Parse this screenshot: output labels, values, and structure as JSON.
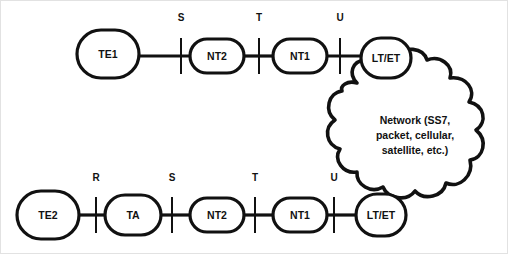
{
  "diagram": {
    "type": "network-reference-model",
    "background_color": "#ffffff",
    "line_color": "#111111",
    "rows": [
      {
        "id": "top-row",
        "nodes": [
          {
            "id": "te1",
            "label": "TE1",
            "cx": 108,
            "cy": 54,
            "rx": 31,
            "ry": 24,
            "shape": "rounded-ellipse"
          },
          {
            "id": "nt2-top",
            "label": "NT2",
            "cx": 217,
            "cy": 56,
            "rx": 27,
            "ry": 17,
            "shape": "rounded-ellipse"
          },
          {
            "id": "nt1-top",
            "label": "NT1",
            "cx": 300,
            "cy": 56,
            "rx": 27,
            "ry": 17,
            "shape": "rounded-ellipse"
          },
          {
            "id": "lt-et-top",
            "label": "LT/ET",
            "cx": 386,
            "cy": 58,
            "rx": 25,
            "ry": 19,
            "shape": "rounded-ellipse"
          }
        ],
        "reference_points": [
          {
            "id": "ref-s-top",
            "label": "S",
            "x": 181,
            "label_y": 21,
            "tick_top": 38,
            "tick_bottom": 74
          },
          {
            "id": "ref-t-top",
            "label": "T",
            "x": 259,
            "label_y": 21,
            "tick_top": 38,
            "tick_bottom": 74
          },
          {
            "id": "ref-u-top",
            "label": "U",
            "x": 340,
            "label_y": 21,
            "tick_top": 38,
            "tick_bottom": 74
          }
        ],
        "links": [
          {
            "id": "link-te1-nt2",
            "x1": 139,
            "x2": 190,
            "y": 56
          },
          {
            "id": "link-nt2-nt1",
            "x1": 244,
            "x2": 273,
            "y": 56
          },
          {
            "id": "link-nt1-lt",
            "x1": 327,
            "x2": 361,
            "y": 56
          }
        ]
      },
      {
        "id": "bottom-row",
        "nodes": [
          {
            "id": "te2",
            "label": "TE2",
            "cx": 48,
            "cy": 215,
            "rx": 31,
            "ry": 24,
            "shape": "rounded-ellipse"
          },
          {
            "id": "ta",
            "label": "TA",
            "cx": 133,
            "cy": 215,
            "rx": 28,
            "ry": 20,
            "shape": "rounded-ellipse"
          },
          {
            "id": "nt2-bottom",
            "label": "NT2",
            "cx": 217,
            "cy": 215,
            "rx": 27,
            "ry": 17,
            "shape": "rounded-ellipse"
          },
          {
            "id": "nt1-bottom",
            "label": "NT1",
            "cx": 300,
            "cy": 215,
            "rx": 27,
            "ry": 17,
            "shape": "rounded-ellipse"
          },
          {
            "id": "lt-et-bottom",
            "label": "LT/ET",
            "cx": 380,
            "cy": 214,
            "rx": 25,
            "ry": 21,
            "shape": "rounded-ellipse"
          }
        ],
        "reference_points": [
          {
            "id": "ref-r-bottom",
            "label": "R",
            "x": 96,
            "label_y": 181,
            "tick_top": 197,
            "tick_bottom": 233
          },
          {
            "id": "ref-s-bottom",
            "label": "S",
            "x": 172,
            "label_y": 181,
            "tick_top": 197,
            "tick_bottom": 233
          },
          {
            "id": "ref-t-bottom",
            "label": "T",
            "x": 255,
            "label_y": 181,
            "tick_top": 197,
            "tick_bottom": 233
          },
          {
            "id": "ref-u-bottom",
            "label": "U",
            "x": 334,
            "label_y": 181,
            "tick_top": 197,
            "tick_bottom": 233
          }
        ],
        "links": [
          {
            "id": "link-te2-ta",
            "x1": 79,
            "x2": 105,
            "y": 215
          },
          {
            "id": "link-ta-nt2",
            "x1": 161,
            "x2": 190,
            "y": 215
          },
          {
            "id": "link-nt2b-nt1b",
            "x1": 244,
            "x2": 273,
            "y": 215
          },
          {
            "id": "link-nt1b-ltb",
            "x1": 327,
            "x2": 356,
            "y": 215
          }
        ]
      }
    ],
    "cloud": {
      "id": "network-cloud",
      "text_lines": [
        "Network (SS7,",
        "packet, cellular,",
        "satellite, etc.)"
      ],
      "text_center_x": 415,
      "text_start_y": 119,
      "line_height": 15
    }
  }
}
